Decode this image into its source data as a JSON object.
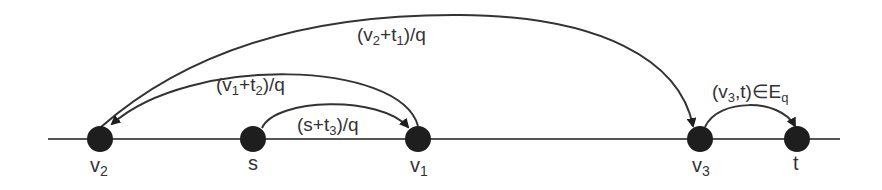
{
  "diagram": {
    "colors": {
      "line": "#333333",
      "node": "#1e1e1e",
      "text": "#333333",
      "background": "#ffffff"
    },
    "baseline": {
      "x1": 48,
      "x2": 840,
      "y": 139
    },
    "nodes": [
      {
        "id": "v2",
        "label_main": "v",
        "label_sub": "2",
        "x": 100
      },
      {
        "id": "s",
        "label_main": "s",
        "label_sub": "",
        "x": 253
      },
      {
        "id": "v1",
        "label_main": "v",
        "label_sub": "1",
        "x": 418
      },
      {
        "id": "v3",
        "label_main": "v",
        "label_sub": "3",
        "x": 700
      },
      {
        "id": "t",
        "label_main": "t",
        "label_sub": "",
        "x": 797
      }
    ],
    "edges": [
      {
        "from": "v2",
        "to": "v3",
        "label": "(v2+t1)/q",
        "parts": [
          "(v",
          "2",
          "+t",
          "1",
          ")/q"
        ]
      },
      {
        "from": "v1",
        "to": "v2",
        "label": "(v1+t2)/q",
        "parts": [
          "(v",
          "1",
          "+t",
          "2",
          ")/q"
        ]
      },
      {
        "from": "s",
        "to": "v1",
        "label": "(s+t3)/q",
        "parts": [
          "(s+t",
          "3",
          ")/q"
        ]
      },
      {
        "from": "v3",
        "to": "t",
        "label": "(v3,t)∈Eq",
        "parts": [
          "(v",
          "3",
          ",t)∈E",
          "q"
        ]
      }
    ]
  }
}
